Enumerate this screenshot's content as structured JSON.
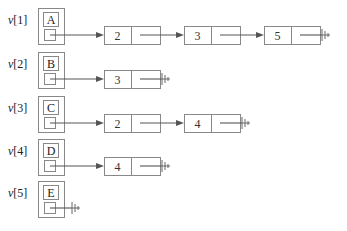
{
  "diagram": {
    "colors": {
      "stroke": "#888888",
      "arrow": "#555555",
      "text": "#222222",
      "background": "#ffffff"
    },
    "rows": [
      {
        "label_prefix": "v",
        "label_index": "[1]",
        "vertex": "A",
        "nodes": [
          "2",
          "3",
          "5"
        ]
      },
      {
        "label_prefix": "v",
        "label_index": "[2]",
        "vertex": "B",
        "nodes": [
          "3"
        ]
      },
      {
        "label_prefix": "v",
        "label_index": "[3]",
        "vertex": "C",
        "nodes": [
          "2",
          "4"
        ]
      },
      {
        "label_prefix": "v",
        "label_index": "[4]",
        "vertex": "D",
        "nodes": [
          "4"
        ]
      },
      {
        "label_prefix": "v",
        "label_index": "[5]",
        "vertex": "E",
        "nodes": []
      }
    ],
    "null_symbol": "ground-null-terminator"
  }
}
